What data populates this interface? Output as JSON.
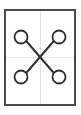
{
  "figure": {
    "name": "x-linkage-four-node-diagram",
    "canvas": {
      "width": 81,
      "height": 115,
      "background_color": "#ffffff"
    },
    "frame": {
      "name": "outer-rectangle",
      "x": 5,
      "y": 10,
      "width": 70,
      "height": 95,
      "stroke_color": "#4a4a4a",
      "stroke_width": 2,
      "fill": "none"
    },
    "guidelines": {
      "stroke_color": "#e2e2e2",
      "stroke_width": 1,
      "lines": [
        {
          "name": "vertical-center-guideline",
          "orientation": "vertical",
          "x1": 40,
          "y1": 10,
          "x2": 40,
          "y2": 105
        },
        {
          "name": "horizontal-center-guideline",
          "orientation": "horizontal",
          "x1": 5,
          "y1": 57,
          "x2": 75,
          "y2": 57
        }
      ]
    },
    "center_point": {
      "name": "crossing-point",
      "x": 40,
      "y": 57
    },
    "nodes": [
      {
        "name": "node-top-left",
        "cx": 21,
        "cy": 37,
        "r": 6.5,
        "stroke_color": "#2f2f2f",
        "stroke_width": 1.8,
        "fill": "#ffffff"
      },
      {
        "name": "node-top-right",
        "cx": 59,
        "cy": 37,
        "r": 6.5,
        "stroke_color": "#2f2f2f",
        "stroke_width": 1.8,
        "fill": "#ffffff"
      },
      {
        "name": "node-bottom-left",
        "cx": 21,
        "cy": 77,
        "r": 6.5,
        "stroke_color": "#2f2f2f",
        "stroke_width": 1.8,
        "fill": "#ffffff"
      },
      {
        "name": "node-bottom-right",
        "cx": 59,
        "cy": 77,
        "r": 6.5,
        "stroke_color": "#2f2f2f",
        "stroke_width": 1.8,
        "fill": "#ffffff"
      }
    ],
    "links": [
      {
        "name": "link-top-left-to-bottom-right",
        "from": "node-top-left",
        "to": "node-bottom-right",
        "x1": 26.2,
        "y1": 41.0,
        "x2": 53.8,
        "y2": 73.0,
        "stroke_color": "#2f2f2f",
        "stroke_width": 2
      },
      {
        "name": "link-top-right-to-bottom-left",
        "from": "node-top-right",
        "to": "node-bottom-left",
        "x1": 53.8,
        "y1": 41.0,
        "x2": 26.2,
        "y2": 73.0,
        "stroke_color": "#2f2f2f",
        "stroke_width": 2
      }
    ]
  }
}
